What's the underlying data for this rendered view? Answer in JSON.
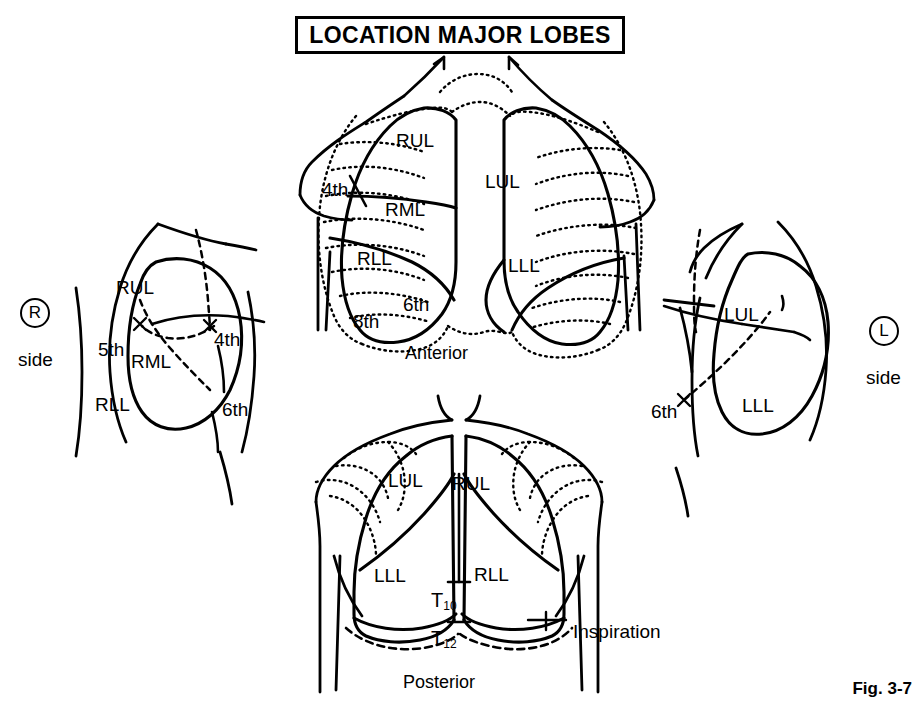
{
  "figure": {
    "title": "LOCATION MAJOR LOBES",
    "number": "Fig. 3-7",
    "type": "anatomical-line-diagram",
    "ink_color": "#000000",
    "background_color": "#ffffff"
  },
  "views": {
    "right_side": {
      "marker_letter": "R",
      "marker_caption": "side",
      "lobes": [
        {
          "abbr": "RUL",
          "x": 116,
          "y": 278
        },
        {
          "abbr": "RML",
          "x": 131,
          "y": 352
        },
        {
          "abbr": "RLL",
          "x": 95,
          "y": 395
        }
      ],
      "ribs": [
        {
          "label": "5th",
          "x": 98,
          "y": 340
        },
        {
          "label": "4th",
          "x": 214,
          "y": 330
        },
        {
          "label": "6th",
          "x": 222,
          "y": 400
        }
      ]
    },
    "anterior": {
      "caption": "Anterior",
      "lobes": [
        {
          "abbr": "RUL",
          "x": 396,
          "y": 131
        },
        {
          "abbr": "RML",
          "x": 385,
          "y": 200
        },
        {
          "abbr": "RLL",
          "x": 357,
          "y": 249
        },
        {
          "abbr": "LUL",
          "x": 485,
          "y": 172
        },
        {
          "abbr": "LLL",
          "x": 508,
          "y": 256
        }
      ],
      "ribs": [
        {
          "label": "4th",
          "x": 322,
          "y": 180
        },
        {
          "label": "6th",
          "x": 403,
          "y": 295
        },
        {
          "label": "8th",
          "x": 353,
          "y": 312
        }
      ]
    },
    "posterior": {
      "caption": "Posterior",
      "lobes": [
        {
          "abbr": "LUL",
          "x": 388,
          "y": 471
        },
        {
          "abbr": "RUL",
          "x": 452,
          "y": 474
        },
        {
          "abbr": "LLL",
          "x": 374,
          "y": 566
        },
        {
          "abbr": "RLL",
          "x": 474,
          "y": 565
        }
      ],
      "vertebrae": [
        {
          "label": "T",
          "sub": "10",
          "x": 431,
          "y": 590
        },
        {
          "label": "T",
          "sub": "12",
          "x": 431,
          "y": 628
        }
      ],
      "annotation": {
        "label": "Inspiration",
        "x": 573,
        "y": 622
      }
    },
    "left_side": {
      "marker_letter": "L",
      "marker_caption": "side",
      "lobes": [
        {
          "abbr": "LUL",
          "x": 724,
          "y": 305
        },
        {
          "abbr": "LLL",
          "x": 742,
          "y": 396
        }
      ],
      "ribs": [
        {
          "label": "6th",
          "x": 651,
          "y": 402
        }
      ]
    }
  }
}
